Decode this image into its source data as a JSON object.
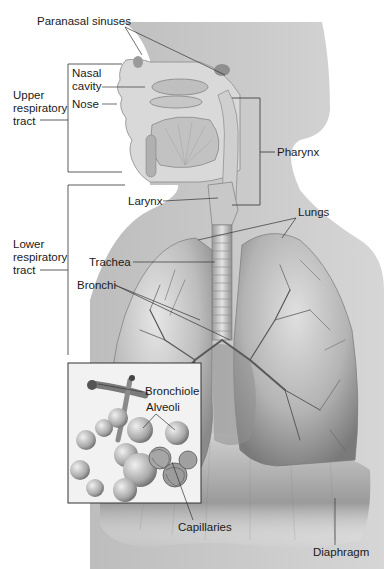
{
  "figure": {
    "colors": {
      "background": "#ffffff",
      "silhouette": "#c9c9c9",
      "tissue_light": "#dcdcdc",
      "tissue_mid": "#a9a9a9",
      "tissue_dark": "#6d6d6d",
      "leader_line": "#3a3a3a",
      "text": "#1a1a1a"
    }
  },
  "labels": {
    "paranasal_sinuses": "Paranasal sinuses",
    "nasal_cavity_1": "Nasal",
    "nasal_cavity_2": "cavity",
    "nose": "Nose",
    "upper_tract_1": "Upper",
    "upper_tract_2": "respiratory",
    "upper_tract_3": "tract",
    "pharynx": "Pharynx",
    "larynx": "Larynx",
    "lungs": "Lungs",
    "lower_tract_1": "Lower",
    "lower_tract_2": "respiratory",
    "lower_tract_3": "tract",
    "trachea": "Trachea",
    "bronchi": "Bronchi",
    "bronchiole": "Bronchiole",
    "alveoli": "Alveoli",
    "capillaries": "Capillaries",
    "diaphragm": "Diaphragm"
  },
  "groupings": {
    "upper_respiratory_tract": [
      "Nasal cavity",
      "Nose",
      "Paranasal sinuses",
      "Pharynx"
    ],
    "lower_respiratory_tract": [
      "Larynx",
      "Trachea",
      "Bronchi",
      "Lungs"
    ],
    "inset": [
      "Bronchiole",
      "Alveoli",
      "Capillaries"
    ]
  }
}
